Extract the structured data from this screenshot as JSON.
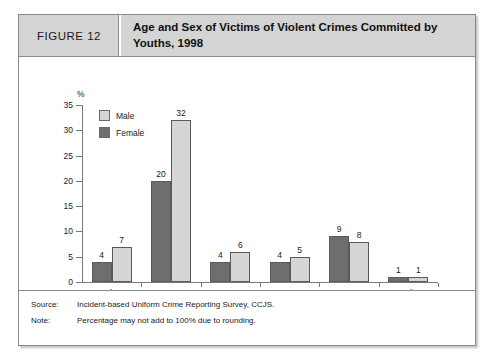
{
  "figure": {
    "number_label": "FIGURE 12",
    "title": "Age and Sex of Victims of Violent Crimes Committed by Youths, 1998"
  },
  "footer": {
    "source_key": "Source:",
    "source_value": "Incident-based Uniform Crime Reporting Survey, CCJS.",
    "note_key": "Note:",
    "note_value": "Percentage may not add to 100% due to rounding."
  },
  "colors": {
    "male_fill": "#d6d6d6",
    "female_fill": "#6e6e6e",
    "bar_stroke": "#5a5a5a",
    "axis": "#7a7a7a",
    "header_bg": "#d4d4d4"
  },
  "chart_data": {
    "type": "bar",
    "title": "Age and Sex of Victims of Violent Crimes Committed by Youths, 1998",
    "xlabel": "Victim age",
    "ylabel": "%",
    "unit_label": "%",
    "ylim": [
      0,
      35
    ],
    "yticks": [
      0,
      5,
      10,
      15,
      20,
      25,
      30,
      35
    ],
    "grid": false,
    "legend_position": "top-left-inside",
    "categories": [
      "Less than 12",
      "12 to 17",
      "18 to 24",
      "25 to 34",
      "35 to 54",
      "55 and over"
    ],
    "series": [
      {
        "name": "Female",
        "values": [
          4,
          20,
          4,
          4,
          9,
          1
        ]
      },
      {
        "name": "Male",
        "values": [
          7,
          32,
          6,
          5,
          8,
          1
        ]
      }
    ]
  }
}
